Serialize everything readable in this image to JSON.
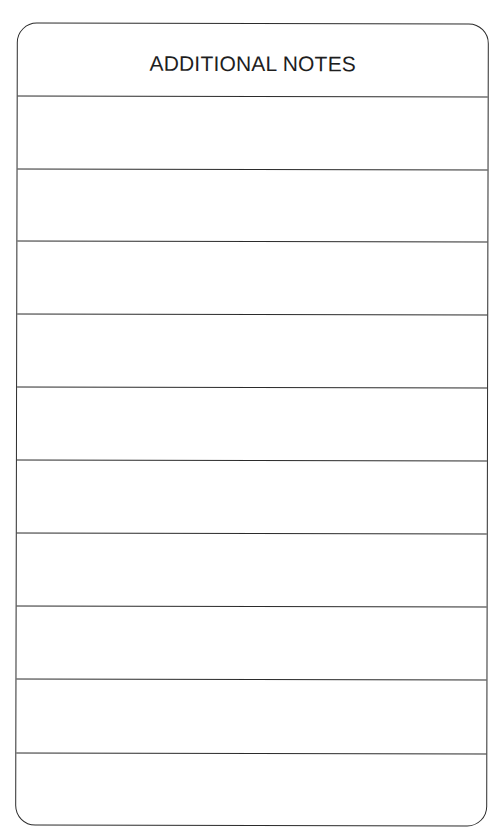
{
  "form": {
    "title": "ADDITIONAL NOTES",
    "line_count": 10,
    "rows": [
      {
        "value": ""
      },
      {
        "value": ""
      },
      {
        "value": ""
      },
      {
        "value": ""
      },
      {
        "value": ""
      },
      {
        "value": ""
      },
      {
        "value": ""
      },
      {
        "value": ""
      },
      {
        "value": ""
      },
      {
        "value": ""
      }
    ]
  }
}
